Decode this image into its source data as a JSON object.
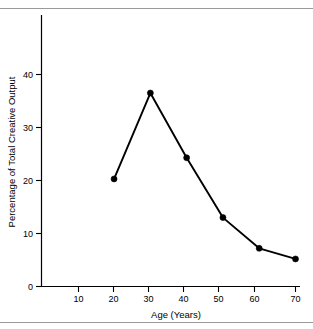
{
  "figure": {
    "background_color": "#ffffff",
    "rule_color": "#9a9a9a",
    "line_color": "#000000"
  },
  "chart_data": {
    "type": "line",
    "title": "",
    "xlabel": "Age (Years)",
    "ylabel": "Percentage of Total Creative Output",
    "x": [
      20,
      30,
      40,
      50,
      60,
      70
    ],
    "values": [
      20.3,
      36.5,
      24.3,
      13.0,
      7.2,
      5.2
    ],
    "series": [
      {
        "name": "Creative output by age",
        "values": [
          20.3,
          36.5,
          24.3,
          13.0,
          7.2,
          5.2
        ]
      }
    ],
    "xlim": [
      0,
      72
    ],
    "ylim": [
      0,
      51
    ],
    "xticks": [
      0,
      10,
      20,
      30,
      40,
      50,
      60,
      70
    ],
    "xticklabels": [
      "0",
      "10",
      "20",
      "30",
      "40",
      "50",
      "60",
      "70"
    ],
    "yticks": [
      0,
      10,
      20,
      30,
      40
    ],
    "yticklabels": [
      "0",
      "10",
      "20",
      "30",
      "40"
    ],
    "grid": false,
    "legend": "none",
    "marker": "filled-circle",
    "line_color": "#000000"
  },
  "axes": {
    "y_tick_0": "0",
    "y_tick_10": "10",
    "y_tick_20": "20",
    "y_tick_30": "30",
    "y_tick_40": "40",
    "x_tick_10": "10",
    "x_tick_20": "20",
    "x_tick_30": "30",
    "x_tick_40": "40",
    "x_tick_50": "50",
    "x_tick_60": "60",
    "x_tick_70": "70",
    "x_title": "Age (Years)",
    "y_title": "Percentage of Total Creative Output"
  }
}
